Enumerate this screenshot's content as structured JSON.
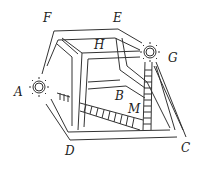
{
  "diagram": {
    "labels": {
      "A": "A",
      "B": "B",
      "C": "C",
      "D": "D",
      "E": "E",
      "F": "F",
      "G": "G",
      "H": "H",
      "M": "M"
    },
    "lamps": [
      {
        "point": "A",
        "icon": "sun-lamp-icon"
      },
      {
        "point": "G",
        "icon": "sun-lamp-icon"
      }
    ],
    "ladders": [
      {
        "name": "vertical-ladder",
        "near": "G-M"
      },
      {
        "name": "slanted-ladder",
        "near": "A-M"
      }
    ],
    "colors": {
      "stroke": "#333333",
      "background": "#ffffff"
    }
  }
}
